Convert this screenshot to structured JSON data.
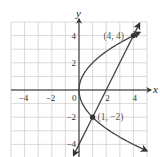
{
  "chart_data": {
    "type": "line",
    "title": "",
    "xlabel": "x",
    "ylabel": "y",
    "xlim": [
      -5,
      5
    ],
    "ylim": [
      -5,
      5
    ],
    "grid": true,
    "x_ticks": [
      -4,
      -2,
      0,
      2,
      4
    ],
    "y_ticks": [
      4,
      2,
      -2,
      -4
    ],
    "x_tick_labels": [
      "−4",
      "−2",
      "0",
      "2",
      "4"
    ],
    "y_tick_labels": [
      "4",
      "2",
      "−2",
      "−4"
    ],
    "series": [
      {
        "name": "parabola",
        "equation": "y^2 = 4x",
        "x": [
          5.0,
          4.0,
          2.25,
          1.0,
          0.25,
          0.0,
          0.25,
          1.0,
          2.25,
          4.0,
          4.6
        ],
        "y": [
          -4.47,
          -4.0,
          -3.0,
          -2.0,
          -1.0,
          0.0,
          1.0,
          2.0,
          3.0,
          4.0,
          4.29
        ]
      },
      {
        "name": "line",
        "equation": "y = 2x - 4",
        "x": [
          -0.4,
          0,
          1,
          2,
          3,
          4,
          4.45
        ],
        "y": [
          -4.8,
          -4,
          -2,
          0,
          2,
          4,
          4.9
        ]
      }
    ],
    "points": [
      {
        "x": 4,
        "y": 4,
        "label": "(4, 4)"
      },
      {
        "x": 1,
        "y": -2,
        "label": "(1, −2)"
      }
    ],
    "colors": {
      "curve": "#444444",
      "grid": "#cfcfcf",
      "axis": "#222222"
    }
  }
}
